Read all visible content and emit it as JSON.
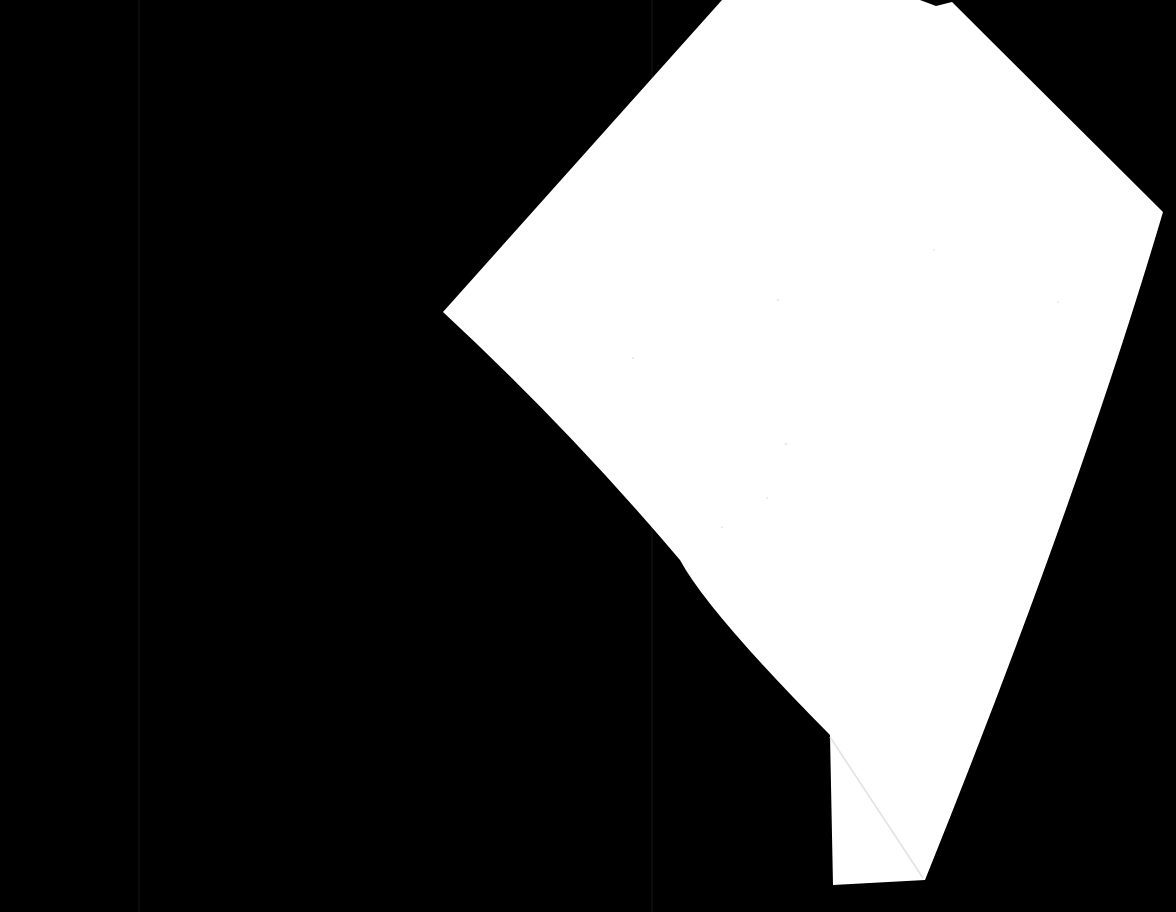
{
  "scene": {
    "title": "White paper sheet on black background",
    "width": 1176,
    "height": 912,
    "background_color": "#000000",
    "paper_color": "#ffffff",
    "description": "A photograph of a single white sheet of paper, rotated and skewed, lying on a pure black surface. The lower-left corner of the sheet is folded over, producing a visible diagonal crease. Two very faint vertical seams are visible in the black background."
  },
  "background": {
    "name": "black-backdrop",
    "color": "#000000",
    "seams": [
      {
        "name": "left-seam",
        "x": 138,
        "color": "#0b0b0b",
        "width": 2
      },
      {
        "name": "right-seam",
        "x": 651,
        "color": "#0b0b0b",
        "width": 2
      }
    ]
  },
  "paper": {
    "name": "paper-sheet",
    "fill": "#ffffff",
    "vertices": [
      {
        "label": "top-edge-left-crossing",
        "x": 722,
        "y": 0
      },
      {
        "label": "top-notch-start",
        "x": 920,
        "y": 0
      },
      {
        "label": "top-notch-bump",
        "x": 936,
        "y": 6
      },
      {
        "label": "top-notch-end",
        "x": 952,
        "y": 2
      },
      {
        "label": "top-right-corner",
        "x": 1163,
        "y": 212
      },
      {
        "label": "right-edge-mid",
        "x": 1040,
        "y": 560
      },
      {
        "label": "bottom-right-corner",
        "x": 925,
        "y": 880
      },
      {
        "label": "bottom-left-corner",
        "x": 833,
        "y": 885
      },
      {
        "label": "fold-apex",
        "x": 830,
        "y": 735
      },
      {
        "label": "left-edge-mid",
        "x": 680,
        "y": 560
      },
      {
        "label": "left-corner",
        "x": 443,
        "y": 312
      }
    ],
    "fold": {
      "name": "folded-corner-crease",
      "from": {
        "x": 830,
        "y": 737
      },
      "to": {
        "x": 923,
        "y": 878
      },
      "color": "#e2e2e2"
    },
    "specks": [
      {
        "x": 778,
        "y": 300,
        "r": 1.2
      },
      {
        "x": 633,
        "y": 358,
        "r": 1.1
      },
      {
        "x": 786,
        "y": 444,
        "r": 1.3
      },
      {
        "x": 767,
        "y": 498,
        "r": 1.0
      },
      {
        "x": 722,
        "y": 527,
        "r": 1.1
      },
      {
        "x": 1058,
        "y": 302,
        "r": 1.0
      },
      {
        "x": 934,
        "y": 250,
        "r": 0.9
      }
    ]
  }
}
